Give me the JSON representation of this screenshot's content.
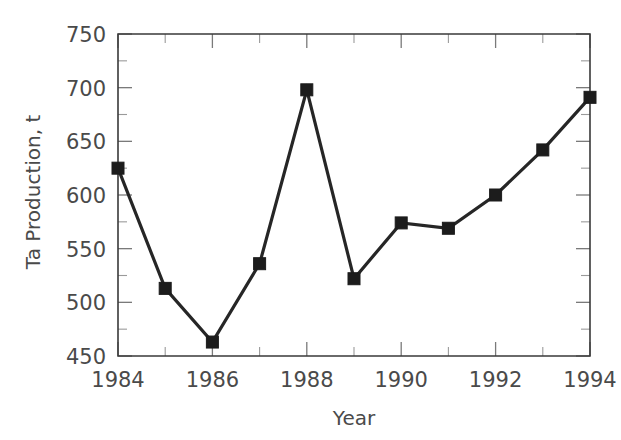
{
  "chart_data": {
    "type": "line",
    "title": "",
    "xlabel": "Year",
    "ylabel": "Ta Production, t",
    "x": [
      1984,
      1985,
      1986,
      1987,
      1988,
      1989,
      1990,
      1991,
      1992,
      1993,
      1994
    ],
    "values": [
      625,
      513,
      463,
      536,
      698,
      522,
      574,
      569,
      600,
      642,
      691
    ],
    "series": [
      {
        "name": "Ta Production",
        "values": [
          625,
          513,
          463,
          536,
          698,
          522,
          574,
          569,
          600,
          642,
          691
        ]
      }
    ],
    "xlim": [
      1984,
      1994
    ],
    "ylim": [
      450,
      750
    ],
    "y_ticks_major": [
      450,
      500,
      550,
      600,
      650,
      700,
      750
    ],
    "y_tick_labels": [
      "450",
      "500",
      "550",
      "600",
      "650",
      "700",
      "750"
    ],
    "y_minor_step": 25,
    "x_ticks_major": [
      1984,
      1986,
      1988,
      1990,
      1992,
      1994
    ],
    "x_tick_labels": [
      "1984",
      "1986",
      "1988",
      "1990",
      "1992",
      "1994"
    ],
    "x_minor_ticks": [
      1985,
      1987,
      1989,
      1991,
      1993
    ],
    "grid": false,
    "legend": false,
    "marker": "square",
    "line_color": "#262626",
    "marker_color": "#1c1c1c",
    "axis_color": "#3a3a3a",
    "background": "#ffffff"
  }
}
